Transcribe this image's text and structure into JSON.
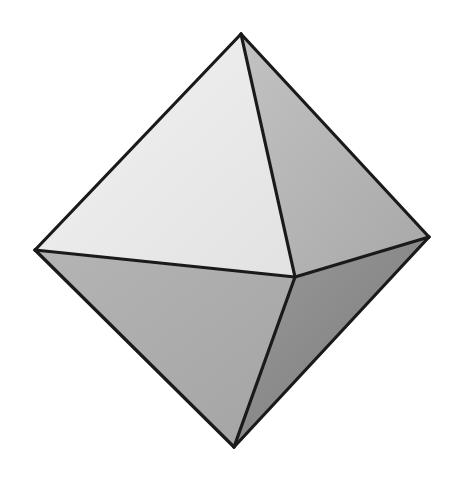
{
  "figure": {
    "background": "#ffffff",
    "stroke_color": "#1a1a1a",
    "stroke_width": 3.2,
    "vertices": {
      "top": [
        241,
        34
      ],
      "left": [
        35,
        250
      ],
      "right": [
        429,
        237
      ],
      "front": [
        295,
        277
      ],
      "bottom": [
        234,
        447
      ]
    },
    "faces": [
      {
        "name": "face-top-left",
        "points": "241,34 35,250 295,277",
        "fill_light": "#f2f2f2",
        "fill_dark": "#e2e2e2"
      },
      {
        "name": "face-top-right",
        "points": "241,34 295,277 429,237",
        "fill_light": "#c2c2c2",
        "fill_dark": "#a8a8a8"
      },
      {
        "name": "face-bottom-left",
        "points": "35,250 295,277 234,447",
        "fill_light": "#b4b4b4",
        "fill_dark": "#a4a4a4"
      },
      {
        "name": "face-bottom-right",
        "points": "295,277 429,237 234,447",
        "fill_light": "#9a9a9a",
        "fill_dark": "#7a7a7a"
      }
    ],
    "edges": [
      {
        "name": "edge-top-left",
        "from": "top",
        "to": "left"
      },
      {
        "name": "edge-top-right",
        "from": "top",
        "to": "right"
      },
      {
        "name": "edge-top-front",
        "from": "top",
        "to": "front"
      },
      {
        "name": "edge-left-front",
        "from": "left",
        "to": "front"
      },
      {
        "name": "edge-front-right",
        "from": "front",
        "to": "right"
      },
      {
        "name": "edge-left-bottom",
        "from": "left",
        "to": "bottom"
      },
      {
        "name": "edge-right-bottom",
        "from": "right",
        "to": "bottom"
      },
      {
        "name": "edge-front-bottom",
        "from": "front",
        "to": "bottom"
      }
    ]
  }
}
